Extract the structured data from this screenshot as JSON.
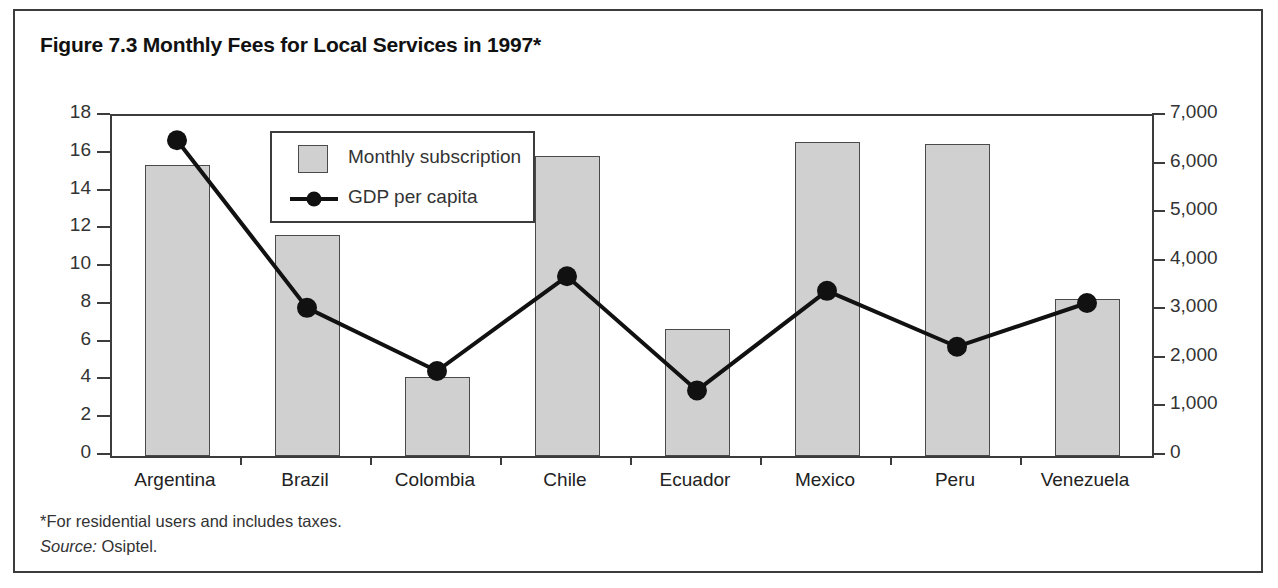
{
  "figure": {
    "title": "Figure 7.3 Monthly Fees for Local Services in 1997*",
    "footnote": "*For residential users and includes taxes.",
    "source_label": "Source:",
    "source_value": "Osiptel."
  },
  "colors": {
    "bar_fill": "#d0d0d0",
    "bar_stroke": "#4a4a4a",
    "line": "#111111",
    "frame": "#3c3c3c",
    "text": "#333333"
  },
  "legend": {
    "position": "inside-top-left",
    "items": [
      {
        "label": "Monthly subscription",
        "marker": "filled-square"
      },
      {
        "label": "GDP per capita",
        "marker": "line-with-dot"
      }
    ]
  },
  "chart_data": {
    "type": "bar",
    "title": "Figure 7.3 Monthly Fees for Local Services in 1997*",
    "xlabel": "",
    "ylabel": "",
    "categories": [
      "Argentina",
      "Brazil",
      "Colombia",
      "Chile",
      "Ecuador",
      "Mexico",
      "Peru",
      "Venezuela"
    ],
    "series": [
      {
        "name": "Monthly subscription",
        "type": "bar",
        "axis": "left",
        "values": [
          15.4,
          11.7,
          4.2,
          15.9,
          6.7,
          16.6,
          16.5,
          8.3
        ]
      },
      {
        "name": "GDP per capita",
        "type": "line",
        "axis": "right",
        "values": [
          6500,
          3050,
          1750,
          3700,
          1350,
          3400,
          2250,
          3150
        ]
      }
    ],
    "left_axis": {
      "ylim": [
        0,
        18
      ],
      "ticks": [
        0,
        2,
        4,
        6,
        8,
        10,
        12,
        14,
        16,
        18
      ],
      "tick_labels": [
        "0",
        "2",
        "4",
        "6",
        "8",
        "10",
        "12",
        "14",
        "16",
        "18"
      ]
    },
    "right_axis": {
      "ylim": [
        0,
        7000
      ],
      "ticks": [
        0,
        1000,
        2000,
        3000,
        4000,
        5000,
        6000,
        7000
      ],
      "tick_labels": [
        "0",
        "1,000",
        "2,000",
        "3,000",
        "4,000",
        "5,000",
        "6,000",
        "7,000"
      ]
    },
    "grid": false,
    "legend_entries": [
      "Monthly subscription",
      "GDP per capita"
    ]
  }
}
